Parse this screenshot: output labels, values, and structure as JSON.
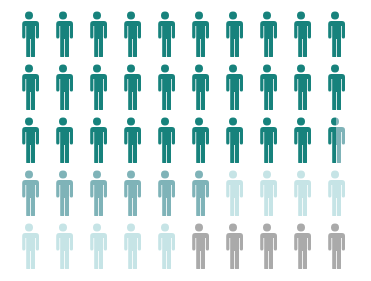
{
  "chart_data": {
    "type": "pictograph",
    "title": "",
    "icon": "person-icon",
    "rows": 5,
    "columns": 10,
    "total_icons": 50,
    "series": [
      {
        "name": "Category 1",
        "color": "#17827c",
        "value": 29.5
      },
      {
        "name": "Category 2",
        "color": "#7fb3b8",
        "value": 6.5
      },
      {
        "name": "Category 3",
        "color": "#c6e4e6",
        "value": 9
      },
      {
        "name": "Category 4",
        "color": "#aaaaaa",
        "value": 5
      }
    ],
    "legend": "none",
    "grid": false
  }
}
